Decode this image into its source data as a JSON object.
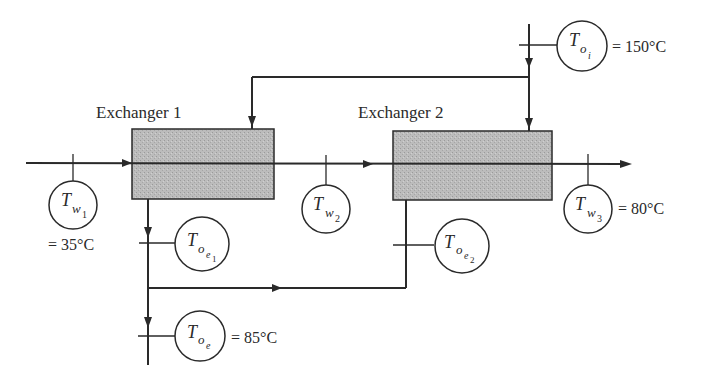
{
  "diagram": {
    "colors": {
      "line": "#2a2a2a",
      "exchanger_fill": "#b8b8b8",
      "background": "#ffffff"
    },
    "exchangers": [
      {
        "id": "exchanger-1",
        "label": "Exchanger 1"
      },
      {
        "id": "exchanger-2",
        "label": "Exchanger 2"
      }
    ],
    "sensors": {
      "t_oi": {
        "main": "T",
        "sub": "o",
        "subsub": "i",
        "value": "= 150°C"
      },
      "t_w1": {
        "main": "T",
        "sub": "w",
        "subsub": "1",
        "value": "= 35°C"
      },
      "t_w2": {
        "main": "T",
        "sub": "w",
        "subsub": "2",
        "value": ""
      },
      "t_w3": {
        "main": "T",
        "sub": "w",
        "subsub": "3",
        "value": "= 80°C"
      },
      "t_oe1": {
        "main": "T",
        "sub": "o",
        "subsub": "e",
        "subsubsub": "1",
        "value": ""
      },
      "t_oe2": {
        "main": "T",
        "sub": "o",
        "subsub": "e",
        "subsubsub": "2",
        "value": ""
      },
      "t_oe": {
        "main": "T",
        "sub": "o",
        "subsub": "e",
        "value": "= 85°C"
      }
    }
  }
}
